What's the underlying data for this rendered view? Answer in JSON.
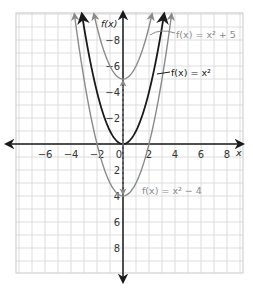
{
  "chart_data": {
    "type": "line",
    "title": "",
    "xlabel": "x",
    "ylabel": "f(x)",
    "xlim": [
      -8,
      9
    ],
    "ylim": [
      -10,
      10
    ],
    "grid": true,
    "x_ticks": [
      -6,
      -4,
      -2,
      0,
      2,
      4,
      6,
      8
    ],
    "y_ticks": [
      -8,
      -6,
      -4,
      -2,
      2,
      4,
      6,
      8
    ],
    "series": [
      {
        "name": "f(x) = x² + 5",
        "expression": "x^2 + 5",
        "shift": 5,
        "color": "#8a8a8a",
        "label_text": "f(x) = x² + 5",
        "vertex": [
          0,
          5
        ]
      },
      {
        "name": "f(x) = x²",
        "expression": "x^2",
        "shift": 0,
        "color": "#1a1a1a",
        "label_text": "f(x) = x²",
        "vertex": [
          0,
          0
        ]
      },
      {
        "name": "f(x) = x² − 4",
        "expression": "x^2 - 4",
        "shift": -4,
        "color": "#8a8a8a",
        "label_text": "f(x) = x² − 4",
        "vertex": [
          0,
          -4
        ]
      }
    ],
    "annotations": [
      {
        "type": "dashed-arrow",
        "from": [
          0,
          0
        ],
        "to": [
          0,
          5
        ],
        "color": "#8a8a8a"
      },
      {
        "type": "dashed-arrow",
        "from": [
          0,
          0
        ],
        "to": [
          0,
          -4
        ],
        "color": "#8a8a8a"
      }
    ]
  },
  "labels": {
    "x_axis": "x",
    "y_axis": "f(x)",
    "curve_upper": "f(x) = x² + 5",
    "curve_middle": "f(x) = x²",
    "curve_lower": "f(x) = x² − 4"
  },
  "ticks": {
    "x": [
      "−6",
      "−4",
      "−2",
      "0",
      "2",
      "4",
      "6",
      "8"
    ],
    "y": [
      "8",
      "6",
      "4",
      "2",
      "−2",
      "−4",
      "−6",
      "−8"
    ]
  }
}
